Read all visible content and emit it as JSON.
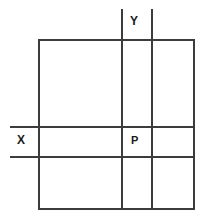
{
  "figure": {
    "background_color": "#ffffff",
    "stroke_color": "#3c3c3c",
    "label_color": "#1b1b1b",
    "stroke_width": 2,
    "canvas": {
      "width": 209,
      "height": 224
    },
    "outer_rectangle": {
      "name": "outer-rectangle",
      "x1": 39,
      "y1": 40,
      "x2": 194,
      "y2": 209
    },
    "vertical_lines": [
      {
        "name": "vertical-line-left",
        "x": 122,
        "y1": 9,
        "y2": 209
      },
      {
        "name": "vertical-line-right",
        "x": 152,
        "y1": 9,
        "y2": 209
      }
    ],
    "horizontal_lines": [
      {
        "name": "horizontal-line-upper",
        "y": 127,
        "x1": 10,
        "x2": 194
      },
      {
        "name": "horizontal-line-lower",
        "y": 157,
        "x1": 10,
        "x2": 194
      }
    ],
    "labels": [
      {
        "name": "label-y",
        "text": "Y",
        "x": 136,
        "y": 22
      },
      {
        "name": "label-x",
        "text": "X",
        "x": 23,
        "y": 141
      },
      {
        "name": "label-p",
        "text": "P",
        "x": 136,
        "y": 141
      }
    ]
  }
}
